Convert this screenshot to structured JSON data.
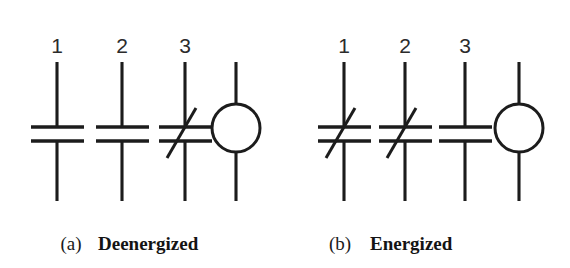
{
  "figure": {
    "type": "relay-contact-symbol-diagram",
    "background_color": "#ffffff",
    "line_color": "#1c1c1c",
    "panels": [
      {
        "id": "panel-a",
        "caption_letter": "(a)",
        "caption_word": "Deenergized",
        "terminal_labels": [
          "1",
          "2",
          "3"
        ],
        "contacts": [
          {
            "label": "1",
            "slashed": false
          },
          {
            "label": "2",
            "slashed": false
          },
          {
            "label": "3",
            "slashed": true
          }
        ],
        "coil": {
          "shape": "circle",
          "label": ""
        }
      },
      {
        "id": "panel-b",
        "caption_letter": "(b)",
        "caption_word": "Energized",
        "terminal_labels": [
          "1",
          "2",
          "3"
        ],
        "contacts": [
          {
            "label": "1",
            "slashed": true
          },
          {
            "label": "2",
            "slashed": true
          },
          {
            "label": "3",
            "slashed": false
          }
        ],
        "coil": {
          "shape": "circle",
          "label": ""
        }
      }
    ]
  }
}
